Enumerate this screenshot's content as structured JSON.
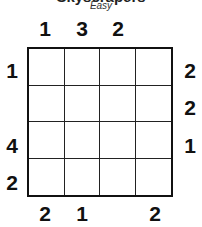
{
  "header": {
    "title": "Skyscrapers",
    "difficulty": "Easy"
  },
  "puzzle": {
    "size": 4,
    "clues": {
      "top": [
        "1",
        "3",
        "2",
        ""
      ],
      "bottom": [
        "2",
        "1",
        "",
        "2"
      ],
      "left": [
        "1",
        "",
        "4",
        "2"
      ],
      "right": [
        "2",
        "2",
        "1",
        ""
      ]
    },
    "cells": [
      [
        "",
        "",
        "",
        ""
      ],
      [
        "",
        "",
        "",
        ""
      ],
      [
        "",
        "",
        "",
        ""
      ],
      [
        "",
        "",
        "",
        ""
      ]
    ]
  }
}
